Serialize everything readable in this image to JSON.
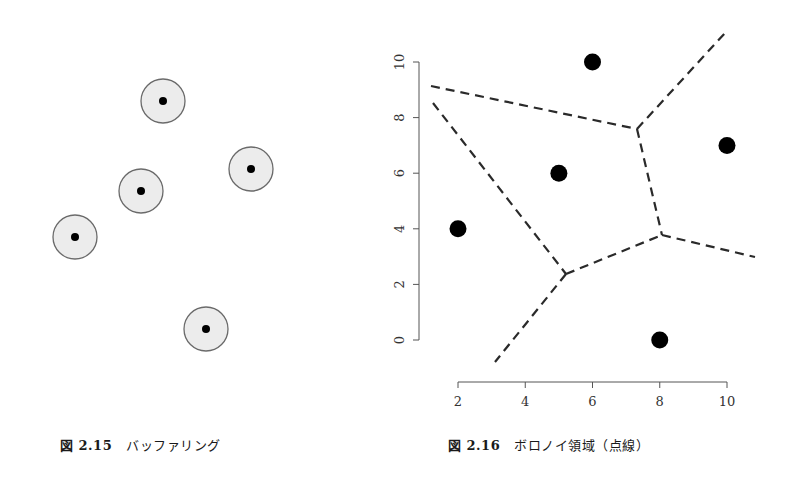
{
  "figures": [
    {
      "id": "fig-2-15",
      "caption_number": "図 2.15",
      "caption_text": "バッファリング",
      "buffer_fill": "#ececec",
      "buffer_stroke": "#6a6a6a",
      "point_color": "#000000",
      "points_px": [
        {
          "cx": 163,
          "cy": 101
        },
        {
          "cx": 251,
          "cy": 169
        },
        {
          "cx": 141,
          "cy": 191
        },
        {
          "cx": 75,
          "cy": 237
        },
        {
          "cx": 206,
          "cy": 329
        }
      ],
      "buffer_radius_px": 22,
      "point_radius_px": 4
    },
    {
      "id": "fig-2-16",
      "caption_number": "図 2.16",
      "caption_text": "ボロノイ領域（点線）",
      "x_ticks": [
        "2",
        "4",
        "6",
        "8",
        "10"
      ],
      "y_ticks": [
        "0",
        "2",
        "4",
        "6",
        "8",
        "10"
      ]
    }
  ],
  "chart_data": {
    "type": "scatter",
    "title": "ボロノイ領域（点線）",
    "xlabel": "",
    "ylabel": "",
    "xlim": [
      2,
      10
    ],
    "ylim": [
      0,
      10
    ],
    "x_ticks": [
      2,
      4,
      6,
      8,
      10
    ],
    "y_ticks": [
      0,
      2,
      4,
      6,
      8,
      10
    ],
    "grid": false,
    "legend": null,
    "series": [
      {
        "name": "points",
        "x": [
          2,
          5,
          6,
          8,
          10
        ],
        "y": [
          4,
          6,
          10,
          0,
          7
        ]
      }
    ],
    "voronoi_vertices": [
      {
        "x": 7.3,
        "y": 7.5
      },
      {
        "x": 8.1,
        "y": 3.7
      },
      {
        "x": 5.2,
        "y": 2.3
      }
    ],
    "voronoi_edges_dashed": [
      {
        "from": [
          1.6,
          9.1
        ],
        "to": [
          7.3,
          7.5
        ]
      },
      {
        "from": [
          1.6,
          8.5
        ],
        "to": [
          5.2,
          2.3
        ]
      },
      {
        "from": [
          7.3,
          7.5
        ],
        "to": [
          10.0,
          11.0
        ]
      },
      {
        "from": [
          7.3,
          7.5
        ],
        "to": [
          8.1,
          3.7
        ]
      },
      {
        "from": [
          5.2,
          2.3
        ],
        "to": [
          8.1,
          3.7
        ]
      },
      {
        "from": [
          8.1,
          3.7
        ],
        "to": [
          10.8,
          2.9
        ]
      },
      {
        "from": [
          5.2,
          2.3
        ],
        "to": [
          3.1,
          -0.8
        ]
      }
    ]
  }
}
